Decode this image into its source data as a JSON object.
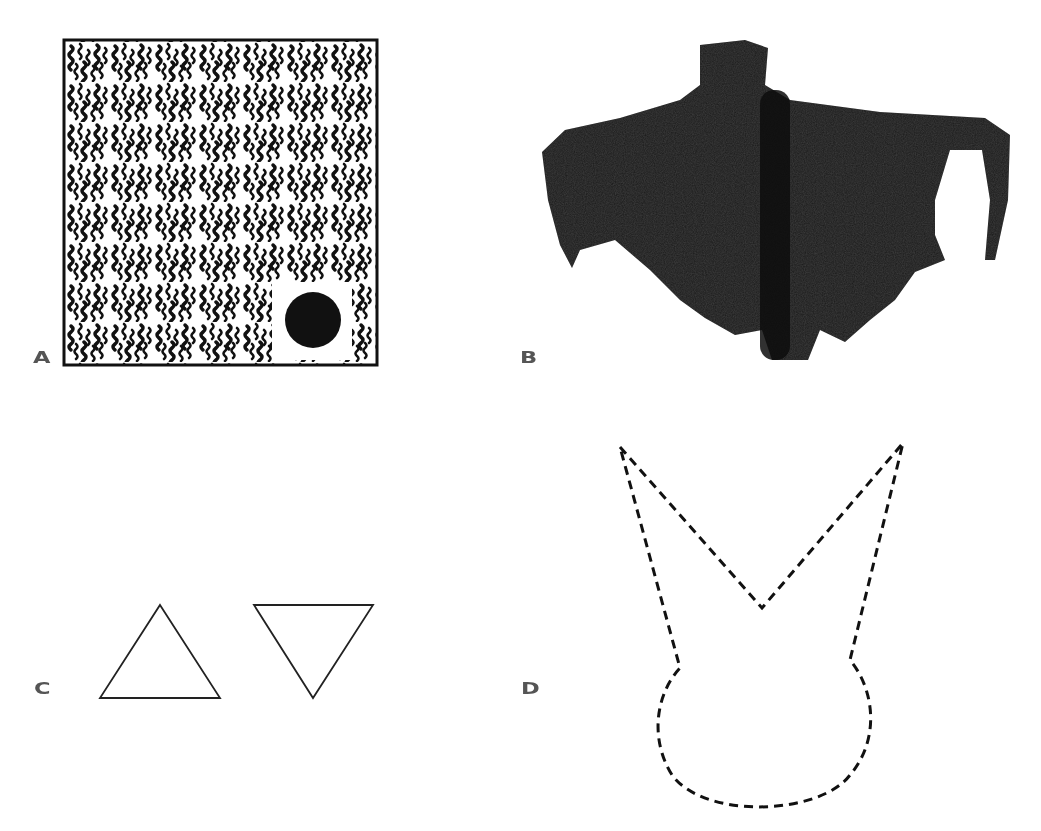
{
  "figure": {
    "panels": [
      {
        "id": "A",
        "label": "A",
        "description": "Square frame filled with black wavy squiggle texture and a solid black circle near bottom-right"
      },
      {
        "id": "B",
        "label": "B",
        "description": "Photograph of a dark moth with spread wings, seen from above"
      },
      {
        "id": "C",
        "label": "C",
        "description": "Two outline triangles: one pointing up, one pointing down"
      },
      {
        "id": "D",
        "label": "D",
        "description": "Dashed outline shape: circular head with two pointed ear-like projections (moth silhouette abstraction)"
      }
    ],
    "colors": {
      "ink": "#111111",
      "label": "#555555",
      "background": "#ffffff"
    }
  }
}
